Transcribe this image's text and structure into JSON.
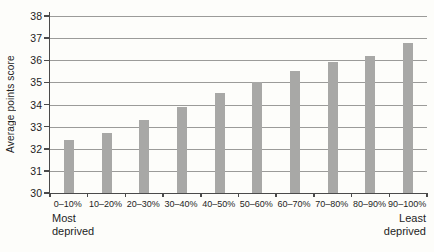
{
  "chart_data": {
    "type": "bar",
    "title": "",
    "xlabel": "",
    "ylabel": "Average points score",
    "categories": [
      "0–10%",
      "10–20%",
      "20–30%",
      "30–40%",
      "40–50%",
      "50–60%",
      "60–70%",
      "70–80%",
      "80–90%",
      "90–100%"
    ],
    "values": [
      32.4,
      32.7,
      33.3,
      33.9,
      34.5,
      35.0,
      35.5,
      35.9,
      36.2,
      36.8
    ],
    "ylim": [
      30,
      38
    ],
    "yticks": [
      30,
      31,
      32,
      33,
      34,
      35,
      36,
      37,
      38
    ],
    "grid": true,
    "legend": "none",
    "bar_color": "#a8a8a6",
    "x_end_annotations": {
      "left": "Most\ndeprived",
      "right": "Least\ndeprived"
    }
  }
}
